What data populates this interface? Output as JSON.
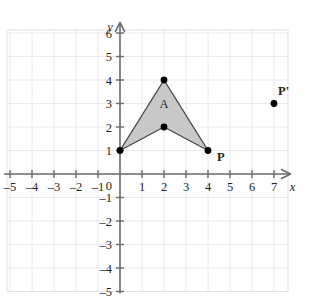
{
  "figure": {
    "title_fragment": "",
    "background_color": "#ffffff",
    "grid_color": "#e8e8ee",
    "grid_border_color": "#e2e2ea",
    "axis_color": "#6b6b6b",
    "shape_fill_color": "#c8c8c8",
    "shape_stroke_color": "#4a4a4a",
    "point_color": "#000000",
    "text_color": "#231f20"
  },
  "axes": {
    "x_label": "x",
    "y_label": "y",
    "origin_label": "0",
    "x_ticks": [
      "-5",
      "-4",
      "-3",
      "-2",
      "-1",
      "1",
      "2",
      "3",
      "4",
      "5",
      "6",
      "7"
    ],
    "y_ticks": [
      "6",
      "5",
      "4",
      "3",
      "2",
      "1",
      "-1",
      "-2",
      "-3",
      "-4",
      "-5"
    ],
    "x_range": [
      -5.7,
      7.9
    ],
    "y_range": [
      -5.2,
      6.6
    ],
    "grid": true,
    "grid_step": 1
  },
  "chart_data": {
    "type": "scatter",
    "title": "",
    "xlabel": "x",
    "ylabel": "y",
    "xlim": [
      -5.7,
      7.9
    ],
    "ylim": [
      -5.2,
      6.6
    ],
    "grid": true,
    "legend": "none",
    "shapes": [
      {
        "name": "A",
        "label": "A",
        "label_position": {
          "x": 2,
          "y": 3.0
        },
        "fill": "#c8c8c8",
        "stroke": "#4a4a4a",
        "vertices": [
          {
            "x": 0,
            "y": 1
          },
          {
            "x": 2,
            "y": 4
          },
          {
            "x": 4,
            "y": 1
          },
          {
            "x": 2,
            "y": 2
          }
        ]
      }
    ],
    "points": [
      {
        "label": "",
        "x": 0,
        "y": 1,
        "label_dx": 0,
        "label_dy": 0
      },
      {
        "label": "",
        "x": 2,
        "y": 4,
        "label_dx": 0,
        "label_dy": 0
      },
      {
        "label": "",
        "x": 2,
        "y": 2,
        "label_dx": 0,
        "label_dy": 0
      },
      {
        "label": "P",
        "x": 4,
        "y": 1,
        "label_dx": 9,
        "label_dy": 10
      },
      {
        "label": "P'",
        "x": 7,
        "y": 3,
        "label_dx": 4,
        "label_dy": -9
      }
    ]
  },
  "labels": {
    "point_p": "P",
    "point_p_prime": "P'",
    "shape_a": "A",
    "origin": "0",
    "axis_x": "x",
    "axis_y": "y"
  }
}
